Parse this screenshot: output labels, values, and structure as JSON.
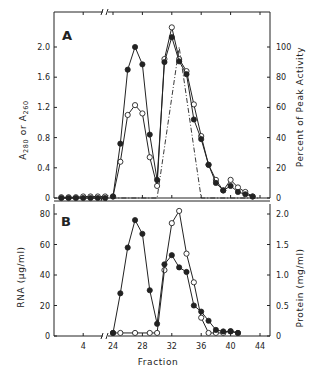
{
  "figure": {
    "panel_a_label": "A",
    "panel_b_label": "B",
    "xlabel": "Fraction",
    "a_ylabel_left": "A280 or A260",
    "a_ylabel_right": "Percent of Peak Activity",
    "b_ylabel_left": "RNA (μg/ml)",
    "b_ylabel_right": "Protein (mg/ml)"
  },
  "chart_data": [
    {
      "type": "line",
      "panel": "A",
      "xlabel": "Fraction",
      "ylabel": "A280 or A260",
      "ylabel_right": "Percent of Peak Activity",
      "ylim": [
        0,
        2.3
      ],
      "ylim_right": [
        0,
        115
      ],
      "yticks": [
        0,
        0.4,
        0.8,
        1.2,
        1.6,
        2.0
      ],
      "yticks_right": [
        0,
        20,
        40,
        60,
        80,
        100
      ],
      "xticks": [
        4,
        24,
        28,
        32,
        36,
        40,
        44
      ],
      "axis_break": "between fraction 8 and 23",
      "series": [
        {
          "name": "A280 (filled circles)",
          "marker": "filled",
          "x": [
            1,
            2,
            3,
            4,
            5,
            6,
            7,
            24,
            25,
            26,
            27,
            28,
            29,
            30,
            31,
            32,
            33,
            34,
            35,
            36,
            37,
            38,
            39,
            40,
            41,
            42,
            43
          ],
          "y": [
            0,
            0,
            0,
            0,
            0,
            0,
            0,
            0.02,
            0.72,
            1.7,
            2.0,
            1.77,
            0.84,
            0.24,
            1.8,
            2.13,
            1.81,
            1.64,
            1.04,
            0.78,
            0.44,
            0.2,
            0.1,
            0.16,
            0.08,
            0.05,
            0.02
          ]
        },
        {
          "name": "A260 (open circles)",
          "marker": "open",
          "x": [
            1,
            2,
            3,
            4,
            5,
            6,
            7,
            24,
            25,
            26,
            27,
            28,
            29,
            30,
            31,
            32,
            33,
            34,
            35,
            36,
            37,
            38,
            39,
            40,
            41,
            42,
            43
          ],
          "y": [
            0.01,
            0.01,
            0.01,
            0.02,
            0.02,
            0.02,
            0.02,
            0.02,
            0.48,
            1.1,
            1.23,
            1.12,
            0.54,
            0.16,
            1.84,
            2.26,
            1.84,
            1.68,
            1.24,
            0.82,
            0.44,
            0.24,
            0.1,
            0.24,
            0.14,
            0.08,
            0.02
          ]
        },
        {
          "name": "Percent of peak activity (dash-dot)",
          "marker": "none",
          "axis": "right",
          "x": [
            1,
            24,
            30,
            33,
            36,
            44
          ],
          "y": [
            0,
            0,
            0,
            100,
            0,
            0
          ]
        }
      ]
    },
    {
      "type": "line",
      "panel": "B",
      "xlabel": "Fraction",
      "ylabel": "RNA (μg/ml)",
      "ylabel_right": "Protein (mg/ml)",
      "ylim": [
        0,
        82
      ],
      "ylim_right": [
        0,
        2.05
      ],
      "yticks": [
        0,
        20,
        40,
        60,
        80
      ],
      "yticks_right": [
        0,
        0.5,
        1.0,
        1.5,
        2.0
      ],
      "xticks": [
        4,
        24,
        28,
        32,
        36,
        40,
        44
      ],
      "series": [
        {
          "name": "RNA (filled circles)",
          "marker": "filled",
          "axis": "left",
          "x": [
            24,
            25,
            26,
            27,
            28,
            29,
            30,
            31,
            32,
            33,
            34,
            35,
            36,
            37,
            38,
            39,
            40,
            41
          ],
          "y": [
            2,
            28,
            58,
            76,
            67,
            30,
            8,
            47,
            53,
            45,
            42,
            20,
            16,
            10,
            4,
            3,
            3,
            2
          ]
        },
        {
          "name": "Protein (open circles)",
          "marker": "open",
          "axis": "right",
          "x": [
            24,
            25,
            27,
            29,
            30,
            31,
            32,
            33,
            34,
            35,
            36,
            37,
            38,
            39,
            40,
            41
          ],
          "y": [
            0.05,
            0.05,
            0.05,
            0.05,
            0.05,
            1.08,
            1.85,
            2.05,
            1.35,
            0.88,
            0.3,
            0.05,
            0.05,
            0.05,
            0.08,
            0.05
          ]
        }
      ]
    }
  ]
}
